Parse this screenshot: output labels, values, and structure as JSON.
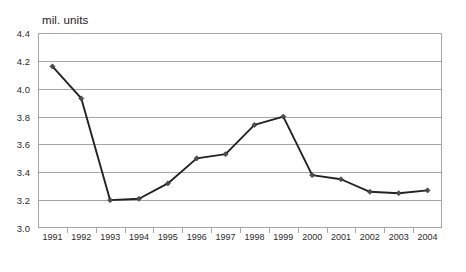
{
  "chart_data": {
    "type": "line",
    "title": "mil. units",
    "xlabel": "",
    "ylabel": "",
    "ylim": [
      3.0,
      4.4
    ],
    "ytick_step": 0.2,
    "yticks": [
      "4.4",
      "4.2",
      "4.0",
      "3.8",
      "3.6",
      "3.4",
      "3.2",
      "3.0"
    ],
    "grid": true,
    "legend": "none",
    "line_color": "#222222",
    "marker_color": "#4d4d4d",
    "marker": "diamond",
    "categories": [
      "1991",
      "1992",
      "1993",
      "1994",
      "1995",
      "1996",
      "1997",
      "1998",
      "1999",
      "2000",
      "2001",
      "2002",
      "2003",
      "2004"
    ],
    "values": [
      4.16,
      3.93,
      3.2,
      3.21,
      3.32,
      3.5,
      3.53,
      3.74,
      3.8,
      3.38,
      3.35,
      3.26,
      3.25,
      3.27
    ]
  }
}
